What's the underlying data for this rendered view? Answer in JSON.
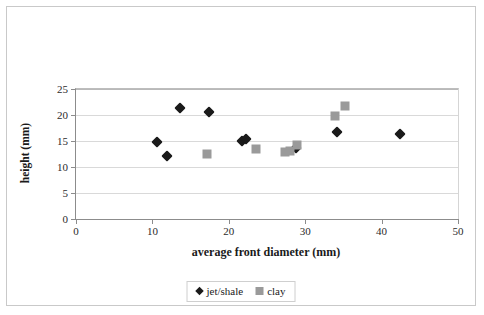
{
  "chart_data": {
    "type": "scatter",
    "title": "",
    "xlabel": "average front diameter (mm)",
    "ylabel": "height (mm)",
    "xlim": [
      0,
      50
    ],
    "ylim": [
      0,
      25
    ],
    "xticks": [
      0,
      10,
      20,
      30,
      40,
      50
    ],
    "yticks": [
      0,
      5,
      10,
      15,
      20,
      25
    ],
    "grid": "horizontal",
    "legend_position": "bottom-center",
    "series": [
      {
        "name": "jet/shale",
        "marker": "diamond",
        "color": "#1a1a1a",
        "points": [
          [
            10.6,
            14.8
          ],
          [
            11.9,
            12.2
          ],
          [
            13.6,
            21.3
          ],
          [
            17.4,
            20.5
          ],
          [
            21.7,
            15.0
          ],
          [
            22.2,
            15.4
          ],
          [
            28.8,
            13.6
          ],
          [
            34.2,
            16.8
          ],
          [
            42.4,
            16.3
          ]
        ]
      },
      {
        "name": "clay",
        "marker": "square",
        "color": "#9a9a9a",
        "points": [
          [
            17.1,
            12.5
          ],
          [
            23.5,
            13.4
          ],
          [
            27.4,
            12.9
          ],
          [
            28.0,
            13.1
          ],
          [
            28.9,
            14.2
          ],
          [
            33.9,
            19.8
          ],
          [
            35.2,
            21.7
          ]
        ]
      }
    ]
  },
  "axes": {
    "y_tick_labels": [
      "0",
      "5",
      "10",
      "15",
      "20",
      "25"
    ],
    "x_tick_labels": [
      "0",
      "10",
      "20",
      "30",
      "40",
      "50"
    ],
    "y_title": "height (mm)",
    "x_title": "average front diameter (mm)"
  },
  "legend": {
    "entries": [
      {
        "label": "jet/shale",
        "marker": "diamond"
      },
      {
        "label": "clay",
        "marker": "square"
      }
    ]
  }
}
